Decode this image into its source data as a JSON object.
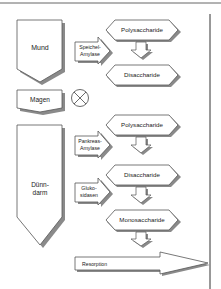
{
  "diagram": {
    "organs": [
      {
        "id": "mund",
        "label": "Mund"
      },
      {
        "id": "magen",
        "label": "Magen"
      },
      {
        "id": "duenndarm",
        "label_line1": "Dünn-",
        "label_line2": "darm"
      }
    ],
    "enzymes": [
      {
        "id": "speichel",
        "line1": "Speichel-",
        "line2": "Amylase"
      },
      {
        "id": "pankreas",
        "line1": "Pankreas-",
        "line2": "Amylase"
      },
      {
        "id": "gluko",
        "line1": "Gluko-",
        "line2": "sidasen"
      }
    ],
    "substrates": [
      {
        "id": "poly1",
        "label": "Polysaccharide"
      },
      {
        "id": "di1",
        "label": "Disaccharide"
      },
      {
        "id": "poly2",
        "label": "Polysaccharide"
      },
      {
        "id": "di2",
        "label": "Disaccharide"
      },
      {
        "id": "mono",
        "label": "Monosaccharide"
      }
    ],
    "magen_symbol": "no-digestion",
    "resorption": {
      "label": "Resorption"
    }
  },
  "colors": {
    "stroke": "#555555",
    "shadow": "#8a8a8a",
    "fill": "#ffffff",
    "text": "#222222"
  }
}
